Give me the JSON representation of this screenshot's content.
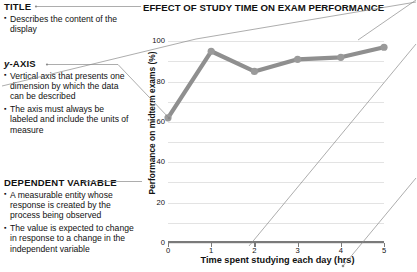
{
  "annotations": [
    {
      "heading": "TITLE",
      "heading_italic_prefix": "",
      "items": [
        "Describes the content of the display"
      ]
    },
    {
      "heading": "y-AXIS",
      "heading_italic_prefix": "y",
      "items": [
        "Vertical axis that presents one dimension by which the data can be described",
        "The axis must always be labeled and include the units of measure"
      ]
    },
    {
      "heading": "DEPENDENT VARIABLE",
      "heading_italic_prefix": "",
      "items": [
        "A measurable entity whose response is created by the process being observed",
        "The value is expected to change in response to a change in the independent variable"
      ]
    }
  ],
  "colors": {
    "series_line": "#8f8f8f",
    "marker_fill": "#9a9a9a",
    "gridline": "#e3e3e3",
    "axis": "#7a7a7a",
    "leader": "#8a8a8a",
    "text": "#111111"
  },
  "chart_data": {
    "type": "line",
    "title": "EFFECT OF STUDY TIME ON EXAM PERFORMANCE",
    "xlabel": "Time spent studying each day (hrs)",
    "ylabel": "Performance on midterm exams (%)",
    "x": [
      0,
      1,
      2,
      3,
      4,
      5
    ],
    "values": [
      62,
      95,
      85,
      91,
      92,
      97
    ],
    "xticks": [
      "0",
      "1",
      "2",
      "3",
      "4",
      "5"
    ],
    "yticks": [
      "0",
      "20",
      "40",
      "60",
      "80",
      "100"
    ],
    "xlim": [
      0,
      5
    ],
    "ylim": [
      0,
      110
    ],
    "grid": true,
    "legend": "none",
    "series": [
      {
        "name": "Performance on midterm exams (%)",
        "values": [
          62,
          95,
          85,
          91,
          92,
          97
        ]
      }
    ]
  }
}
